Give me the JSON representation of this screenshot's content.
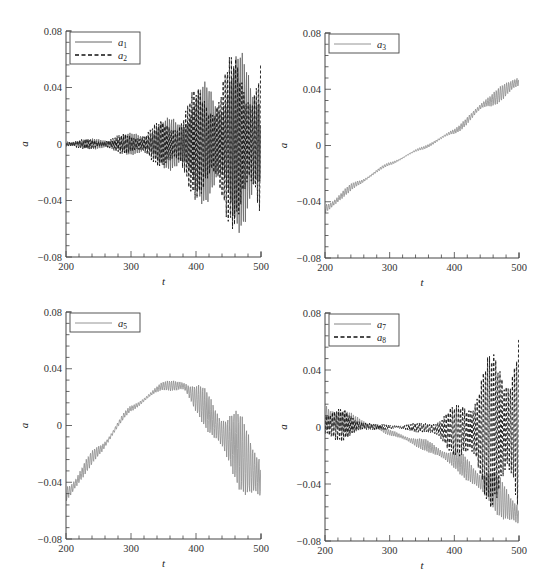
{
  "chart_data": [
    {
      "id": "panel-a1-a2",
      "type": "line",
      "title": "",
      "xlabel": "t",
      "ylabel": "a",
      "xlim": [
        200,
        500
      ],
      "ylim": [
        -0.08,
        0.08
      ],
      "xticks": [
        200,
        300,
        400,
        500
      ],
      "yticks": [
        -0.08,
        -0.04,
        0,
        0.04,
        0.08
      ],
      "ytick_labels": [
        "−0.08",
        "−0.04",
        "0",
        "0.04",
        "0.08"
      ],
      "grid": false,
      "legend_position": "upper-left",
      "legend": [
        {
          "label": "a",
          "sub": "1",
          "style": "solid",
          "color": "#555555"
        },
        {
          "label": "a",
          "sub": "2",
          "style": "dashed",
          "color": "#111111"
        }
      ],
      "series": [
        {
          "name": "a1",
          "style": "solid",
          "color": "#666666",
          "t": [
            200,
            250,
            300,
            350,
            400,
            450,
            500
          ],
          "mean": [
            0,
            0,
            0,
            0,
            0,
            0,
            0
          ],
          "upper": [
            0.003,
            0.004,
            0.008,
            0.017,
            0.04,
            0.063,
            0.073
          ],
          "lower": [
            -0.003,
            -0.004,
            -0.008,
            -0.017,
            -0.04,
            -0.06,
            -0.07
          ]
        },
        {
          "name": "a2",
          "style": "dashed",
          "color": "#111111",
          "t": [
            200,
            250,
            300,
            350,
            400,
            450,
            500
          ],
          "mean": [
            0,
            0,
            0,
            0,
            0,
            0,
            0
          ],
          "upper": [
            0.003,
            0.004,
            0.008,
            0.017,
            0.04,
            0.063,
            0.073
          ],
          "lower": [
            -0.003,
            -0.004,
            -0.008,
            -0.017,
            -0.04,
            -0.06,
            -0.07
          ]
        }
      ]
    },
    {
      "id": "panel-a3",
      "type": "line",
      "title": "",
      "xlabel": "t",
      "ylabel": "a",
      "xlim": [
        200,
        500
      ],
      "ylim": [
        -0.08,
        0.08
      ],
      "xticks": [
        200,
        300,
        400,
        500
      ],
      "yticks": [
        -0.08,
        -0.04,
        0,
        0.04,
        0.08
      ],
      "ytick_labels": [
        "−0.08",
        "−0.04",
        "0",
        "0.04",
        "0.08"
      ],
      "grid": false,
      "legend_position": "upper-left",
      "legend": [
        {
          "label": "a",
          "sub": "3",
          "style": "solid",
          "color": "#888888"
        }
      ],
      "series": [
        {
          "name": "a3",
          "style": "solid",
          "color": "#8a8a8a",
          "t": [
            200,
            250,
            300,
            350,
            400,
            450,
            500
          ],
          "mean": [
            -0.045,
            -0.027,
            -0.013,
            -0.002,
            0.01,
            0.03,
            0.045
          ],
          "upper": [
            -0.04,
            -0.025,
            -0.012,
            -0.001,
            0.012,
            0.035,
            0.053
          ],
          "lower": [
            -0.05,
            -0.029,
            -0.014,
            -0.003,
            0.008,
            0.026,
            0.038
          ]
        }
      ]
    },
    {
      "id": "panel-a5",
      "type": "line",
      "title": "",
      "xlabel": "t",
      "ylabel": "a",
      "xlim": [
        200,
        500
      ],
      "ylim": [
        -0.08,
        0.08
      ],
      "xticks": [
        200,
        300,
        400,
        500
      ],
      "yticks": [
        -0.08,
        -0.04,
        0,
        0.04,
        0.08
      ],
      "ytick_labels": [
        "−0.08",
        "−0.04",
        "0",
        "0.04",
        "0.08"
      ],
      "grid": false,
      "legend_position": "upper-left",
      "legend": [
        {
          "label": "a",
          "sub": "5",
          "style": "solid",
          "color": "#888888"
        }
      ],
      "series": [
        {
          "name": "a5",
          "style": "solid",
          "color": "#8a8a8a",
          "t": [
            200,
            250,
            300,
            350,
            380,
            400,
            450,
            500
          ],
          "mean": [
            -0.05,
            -0.018,
            0.012,
            0.028,
            0.029,
            0.02,
            -0.01,
            -0.035
          ],
          "upper": [
            -0.04,
            -0.014,
            0.014,
            0.031,
            0.034,
            0.03,
            0.015,
            -0.004
          ],
          "lower": [
            -0.057,
            -0.022,
            0.01,
            0.025,
            0.022,
            0.008,
            -0.035,
            -0.07
          ]
        }
      ]
    },
    {
      "id": "panel-a7-a8",
      "type": "line",
      "title": "",
      "xlabel": "t",
      "ylabel": "a",
      "xlim": [
        200,
        500
      ],
      "ylim": [
        -0.08,
        0.08
      ],
      "xticks": [
        200,
        300,
        400,
        500
      ],
      "yticks": [
        -0.08,
        -0.04,
        0,
        0.04,
        0.08
      ],
      "ytick_labels": [
        "−0.08",
        "−0.04",
        "0",
        "0.04",
        "0.08"
      ],
      "grid": false,
      "legend_position": "upper-left",
      "legend": [
        {
          "label": "a",
          "sub": "7",
          "style": "solid",
          "color": "#777777"
        },
        {
          "label": "a",
          "sub": "8",
          "style": "dashed",
          "color": "#111111"
        }
      ],
      "series": [
        {
          "name": "a7",
          "style": "solid",
          "color": "#8a8a8a",
          "t": [
            200,
            250,
            280,
            300,
            350,
            400,
            450,
            500
          ],
          "mean": [
            0.008,
            0.002,
            0.0,
            -0.004,
            -0.012,
            -0.022,
            -0.04,
            -0.06
          ],
          "upper": [
            0.022,
            0.008,
            0.002,
            -0.002,
            -0.008,
            -0.016,
            -0.028,
            -0.045
          ],
          "lower": [
            -0.01,
            -0.004,
            -0.002,
            -0.006,
            -0.016,
            -0.03,
            -0.055,
            -0.078
          ]
        },
        {
          "name": "a8",
          "style": "dashed",
          "color": "#111111",
          "t": [
            200,
            250,
            280,
            300,
            350,
            400,
            450,
            500
          ],
          "mean": [
            0.003,
            0.001,
            0.0,
            0.0,
            0.0,
            0.0,
            0.0,
            0.0
          ],
          "upper": [
            0.018,
            0.008,
            0.002,
            0.002,
            0.003,
            0.015,
            0.05,
            0.08
          ],
          "lower": [
            -0.015,
            -0.006,
            -0.002,
            -0.002,
            -0.004,
            -0.02,
            -0.055,
            -0.08
          ]
        }
      ]
    }
  ]
}
